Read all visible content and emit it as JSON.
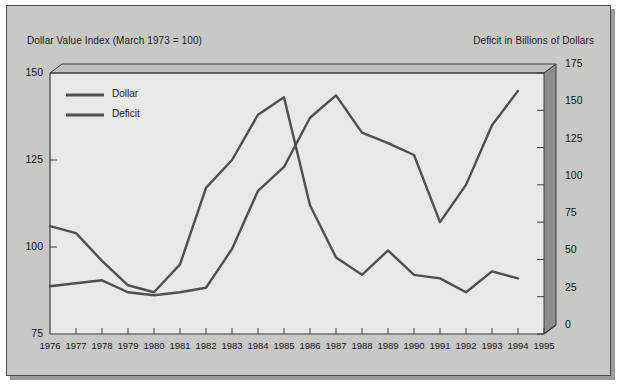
{
  "figure": {
    "title_left": "Dollar Value Index (March 1973 = 100)",
    "title_right": "Deficit in Billions of Dollars",
    "plate_color": "#c8c8c6",
    "plot_color": "#e8e8e6",
    "line_color": "#4f4f52",
    "wall_color": "#8e8e8c"
  },
  "legend": {
    "entries": [
      {
        "label": "Dollar"
      },
      {
        "label": "Deficit"
      }
    ]
  },
  "chart_data": {
    "type": "line",
    "xlabel": "",
    "ylabel": "Dollar Value Index (March 1973 = 100)",
    "y2label": "Deficit in Billions of Dollars",
    "grid": false,
    "legend_position": "upper-left-inside",
    "x": [
      1976,
      1977,
      1978,
      1979,
      1980,
      1981,
      1982,
      1983,
      1984,
      1985,
      1986,
      1987,
      1988,
      1989,
      1990,
      1991,
      1992,
      1993,
      1994
    ],
    "xtick_labels": [
      "1976",
      "1977",
      "1978",
      "1979",
      "1980",
      "1981",
      "1982",
      "1983",
      "1984",
      "1985",
      "1986",
      "1987",
      "1988",
      "1989",
      "1990",
      "1991",
      "1992",
      "1993",
      "1994",
      "1995"
    ],
    "xlim": [
      1976,
      1995
    ],
    "ylim": [
      75,
      150
    ],
    "ytick_labels": [
      "75",
      "100",
      "125",
      "150"
    ],
    "yticks": [
      75,
      100,
      125,
      150
    ],
    "y2lim": [
      0,
      175
    ],
    "y2tick_labels": [
      "0",
      "25",
      "50",
      "75",
      "100",
      "125",
      "150",
      "175"
    ],
    "y2ticks": [
      0,
      25,
      50,
      75,
      100,
      125,
      150,
      175
    ],
    "series": [
      {
        "name": "Dollar",
        "axis": "left",
        "units": "index (March 1973 = 100)",
        "values": [
          106,
          104,
          96,
          89,
          87,
          95,
          117,
          125,
          138,
          143,
          112,
          97,
          92,
          99,
          92,
          91,
          87,
          93,
          91
        ]
      },
      {
        "name": "Deficit",
        "axis": "right",
        "units": "billions of dollars",
        "values": [
          32,
          34,
          36,
          28,
          26,
          28,
          31,
          57,
          96,
          112,
          145,
          160,
          135,
          128,
          120,
          75,
          100,
          140,
          163
        ]
      }
    ]
  }
}
